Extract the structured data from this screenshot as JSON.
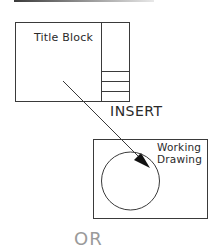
{
  "diagram": {
    "title_block": {
      "label": "Title Block"
    },
    "action": {
      "label": "INSERT"
    },
    "working_drawing": {
      "label_line1": "Working",
      "label_line2": "Drawing"
    },
    "footer": {
      "label": "OR"
    },
    "colors": {
      "stroke": "#3a3a3a",
      "text": "#2a2a2a",
      "arrowhead": "#111111",
      "footer_text": "#9a9a9a"
    }
  }
}
